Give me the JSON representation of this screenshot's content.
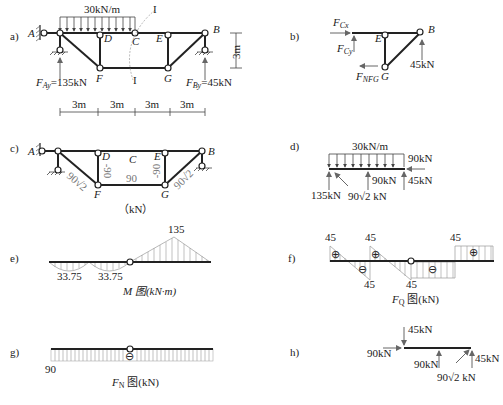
{
  "panels": {
    "a": {
      "label": "a)",
      "load": "30kN/m",
      "section_mark": "I",
      "nodes": [
        "A",
        "D",
        "C",
        "E",
        "B",
        "F",
        "G"
      ],
      "reaction_A": "F",
      "reaction_A_sub": "Ay",
      "reaction_A_val": "=135kN",
      "reaction_B": "F",
      "reaction_B_sub": "By",
      "reaction_B_val": "=45kN",
      "height_dim": "3m",
      "spans": [
        "3m",
        "3m",
        "3m",
        "3m"
      ]
    },
    "b": {
      "label": "b)",
      "fcx": "F",
      "fcx_sub": "Cx",
      "fcy": "F",
      "fcy_sub": "Cy",
      "fnfg": "F",
      "fnfg_sub": "NFG",
      "nodes": [
        "E",
        "B",
        "G"
      ],
      "reaction": "45kN"
    },
    "c": {
      "label": "c)",
      "nodes": [
        "A",
        "D",
        "C",
        "E",
        "B",
        "F",
        "G"
      ],
      "forces": {
        "AF": "90√2",
        "DF": "-90",
        "FG": "90",
        "EG": "-90",
        "GB": "90√2"
      },
      "unit": "（kN）"
    },
    "d": {
      "label": "d)",
      "load": "30kN/m",
      "f_left": "135kN",
      "f_diag": "90√2 kN",
      "f_mid": "90kN",
      "f_right_h": "90kN",
      "f_right_v": "45kN"
    },
    "e": {
      "label": "e)",
      "values": [
        "33.75",
        "33.75",
        "135"
      ],
      "title": "M 图(kN·m)"
    },
    "f": {
      "label": "f)",
      "values_top": [
        "45",
        "45",
        "45"
      ],
      "values_bottom": [
        "45",
        "45"
      ],
      "signs": [
        "⊕",
        "⊖",
        "⊕",
        "⊖",
        "⊕"
      ],
      "title_main": "F",
      "title_sub": "Q",
      "title_rest": " 图(kN)"
    },
    "g": {
      "label": "g)",
      "value": "90",
      "sign": "⊖",
      "title_main": "F",
      "title_sub": "N",
      "title_rest": " 图(kN)"
    },
    "h": {
      "label": "h)",
      "f_top": "45kN",
      "f_left": "90kN",
      "f_mid": "90kN",
      "f_diag": "90√2 kN",
      "f_right": "45kN"
    }
  }
}
